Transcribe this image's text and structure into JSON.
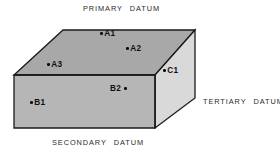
{
  "diagram": {
    "type": "engineering-drawing",
    "background_color": "#ffffff",
    "line_color": "#1a1a1a",
    "faces": {
      "top": {
        "name": "primary-datum-face",
        "fill": "#a8a8a8",
        "points": "14,75 63,30 195,30 155,75"
      },
      "front": {
        "name": "secondary-datum-face",
        "fill": "#b6b6b6",
        "points": "14,75 155,75 155,128 14,128"
      },
      "right": {
        "name": "tertiary-datum-face",
        "fill": "#d9d9d9",
        "points": "155,75 195,30 195,98 155,128"
      }
    },
    "labels": [
      {
        "id": "primary",
        "word1": "PRIMARY",
        "word2": "DATUM"
      },
      {
        "id": "secondary",
        "word1": "SECONDARY",
        "word2": "DATUM"
      },
      {
        "id": "tertiary",
        "word1": "TERTIARY",
        "word2": "DATUM"
      }
    ],
    "datum_targets": [
      {
        "id": "A1",
        "label": "A1",
        "face": "top",
        "dot_side": "left",
        "dot_x": 103,
        "dot_y": 33
      },
      {
        "id": "A2",
        "label": "A2",
        "face": "top",
        "dot_side": "left",
        "dot_x": 129,
        "dot_y": 48
      },
      {
        "id": "A3",
        "label": "A3",
        "face": "top",
        "dot_side": "left",
        "dot_x": 50,
        "dot_y": 64
      },
      {
        "id": "B2",
        "label": "B2",
        "face": "front",
        "dot_side": "right",
        "dot_x": 127,
        "dot_y": 88
      },
      {
        "id": "B1",
        "label": "B1",
        "face": "front",
        "dot_side": "left",
        "dot_x": 33,
        "dot_y": 102
      },
      {
        "id": "C1",
        "label": "C1",
        "face": "right",
        "dot_side": "left",
        "dot_x": 166,
        "dot_y": 70
      }
    ]
  }
}
